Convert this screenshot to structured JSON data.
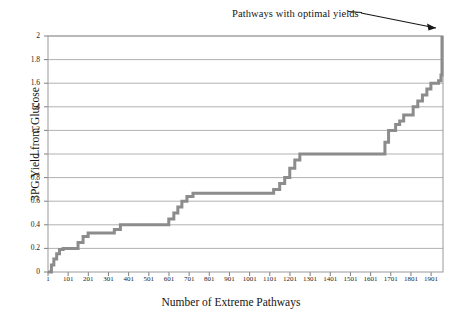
{
  "figure": {
    "annotation": "Pathways with optimal yields",
    "annotation_name": "optimal-yields-annotation"
  },
  "chart_data": {
    "type": "line",
    "subtype": "step",
    "title": "",
    "xlabel": "Number of Extreme Pathways",
    "ylabel": "3PG Yield from Glucose",
    "xlim": [
      1,
      1960
    ],
    "ylim": [
      0,
      2
    ],
    "grid": "horizontal",
    "legend": "none",
    "line_color": "#8c8c8c",
    "line_width": 3,
    "annotations": [
      {
        "text": "Pathways with optimal yields",
        "points_to_x": 1955,
        "points_to_y": 2.0
      }
    ],
    "ytick_labels": [
      "0",
      "0.2",
      "0.4",
      "0.6",
      "0.8",
      "1",
      "1.2",
      "1.4",
      "1.6",
      "1.8",
      "2"
    ],
    "ytick_values": [
      0,
      0.2,
      0.4,
      0.6,
      0.8,
      1.0,
      1.2,
      1.4,
      1.6,
      1.8,
      2.0
    ],
    "xtick_labels": [
      "1",
      "101",
      "201",
      "301",
      "401",
      "501",
      "601",
      "701",
      "801",
      "901",
      "1001",
      "1101",
      "1201",
      "1301",
      "1401",
      "1501",
      "1601",
      "1701",
      "1801",
      "1901"
    ],
    "xtick_values": [
      1,
      101,
      201,
      301,
      401,
      501,
      601,
      701,
      801,
      901,
      1001,
      1101,
      1201,
      1301,
      1401,
      1501,
      1601,
      1701,
      1801,
      1901
    ],
    "x": [
      1,
      18,
      30,
      44,
      58,
      76,
      96,
      130,
      150,
      175,
      200,
      235,
      260,
      300,
      330,
      360,
      400,
      430,
      470,
      520,
      560,
      600,
      625,
      645,
      665,
      690,
      720,
      760,
      800,
      900,
      1000,
      1080,
      1120,
      1150,
      1175,
      1200,
      1225,
      1250,
      1400,
      1550,
      1660,
      1672,
      1690,
      1705,
      1725,
      1745,
      1765,
      1790,
      1812,
      1835,
      1858,
      1880,
      1900,
      1920,
      1938,
      1950,
      1955
    ],
    "y": [
      0.0,
      0.06,
      0.11,
      0.155,
      0.19,
      0.2,
      0.2,
      0.2,
      0.25,
      0.3,
      0.33,
      0.33,
      0.33,
      0.33,
      0.36,
      0.4,
      0.4,
      0.4,
      0.4,
      0.4,
      0.4,
      0.45,
      0.5,
      0.55,
      0.6,
      0.64,
      0.667,
      0.667,
      0.667,
      0.667,
      0.667,
      0.667,
      0.7,
      0.75,
      0.8,
      0.88,
      0.95,
      1.0,
      1.0,
      1.0,
      1.0,
      1.1,
      1.2,
      1.2,
      1.25,
      1.28,
      1.33,
      1.33,
      1.4,
      1.45,
      1.5,
      1.55,
      1.6,
      1.6,
      1.62,
      1.67,
      2.0
    ]
  }
}
